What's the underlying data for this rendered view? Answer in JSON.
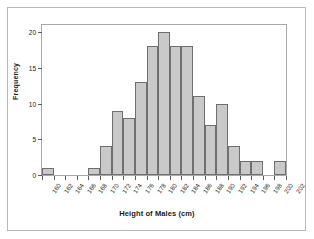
{
  "chart_data": {
    "type": "bar",
    "title": "",
    "xlabel": "Height of Males (cm)",
    "ylabel": "Frequency",
    "bin_width": 2,
    "bin_edges": [
      160,
      162,
      164,
      166,
      168,
      170,
      172,
      174,
      176,
      178,
      180,
      182,
      184,
      186,
      188,
      190,
      192,
      194,
      196,
      198,
      200,
      202
    ],
    "categories": [
      "160-162",
      "162-164",
      "164-166",
      "166-168",
      "168-170",
      "170-172",
      "172-174",
      "174-176",
      "176-178",
      "178-180",
      "180-182",
      "182-184",
      "184-186",
      "186-188",
      "188-190",
      "190-192",
      "192-194",
      "194-196",
      "196-198",
      "198-200",
      "200-202"
    ],
    "values": [
      1,
      0,
      0,
      0,
      1,
      4,
      9,
      8,
      13,
      18,
      20,
      18,
      18,
      11,
      7,
      10,
      4,
      2,
      2,
      0,
      2
    ],
    "xtick_labels": [
      "160",
      "162",
      "164",
      "166",
      "168",
      "170",
      "172",
      "174",
      "176",
      "178",
      "180",
      "182",
      "184",
      "186",
      "188",
      "190",
      "192",
      "194",
      "196",
      "198",
      "200",
      "202"
    ],
    "ytick_labels": [
      "0",
      "5",
      "10",
      "15",
      "20"
    ],
    "ytick_values": [
      0,
      5,
      10,
      15,
      20
    ],
    "ylim": [
      0,
      21
    ],
    "xlim": [
      160,
      202
    ],
    "grid": false,
    "legend": false,
    "bar_fill_color": "#c9c9c9",
    "bar_border_color": "#6f6f6f",
    "frame_color": "#a8a8a8",
    "text_color": "#1a1a1a"
  }
}
